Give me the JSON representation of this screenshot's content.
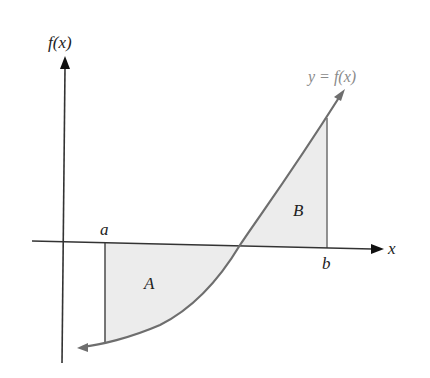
{
  "diagram": {
    "type": "definite-integral-signed-area",
    "labels": {
      "y_axis": "f(x)",
      "x_axis": "x",
      "curve": "y = f(x)",
      "lower_limit": "a",
      "upper_limit": "b",
      "region_below": "A",
      "region_above": "B"
    },
    "colors": {
      "axes": "#333333",
      "curve": "#6e6e6e",
      "fill": "#ececec",
      "text": "#222222",
      "curve_label": "#8a8a8a"
    }
  }
}
